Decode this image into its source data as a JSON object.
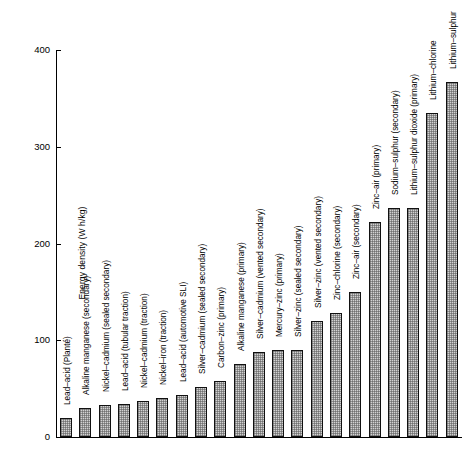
{
  "chart_data": {
    "type": "bar",
    "title": "",
    "xlabel": "",
    "ylabel": "Energy density (W h/kg)",
    "ylim": [
      0,
      400
    ],
    "yticks": [
      0,
      100,
      200,
      300,
      400
    ],
    "ytick_labels": [
      "0",
      "100",
      "200",
      "300",
      "400"
    ],
    "grid": false,
    "legend": false,
    "orientation": "vertical",
    "categories": [
      "Lead–acid (Planté)",
      "Alkaline manganese (secondary)",
      "Nickel–cadmium (sealed secondary)",
      "Lead–acid (tubular traction)",
      "Nickel–cadmium (traction)",
      "Nickel–iron (traction)",
      "Lead–acid (automotive SLI)",
      "Silver–cadmium (sealed secondary)",
      "Carbon–zinc (primary)",
      "Alkaline manganese (primary)",
      "Silver–cadmium (vented secondary)",
      "Mercury–zinc (primary)",
      "Silver–zinc (sealed secondary)",
      "Silver–zinc (vented secondary)",
      "Zinc–chlorine (secondary)",
      "Zinc–air (secondary)",
      "Zinc–air (primary)",
      "Sodium–sulphur (secondary)",
      "Lithium–sulphur dioxide (primary)",
      "Lithium–chlorine",
      "Lithium–sulphur"
    ],
    "values": [
      20,
      30,
      33,
      34,
      37,
      40,
      43,
      52,
      58,
      75,
      88,
      90,
      90,
      120,
      128,
      150,
      222,
      237,
      237,
      335,
      367
    ]
  }
}
